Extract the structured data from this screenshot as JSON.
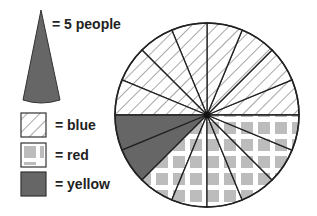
{
  "chart_data": {
    "type": "pie",
    "title": "",
    "unit_label": "= 5 people",
    "unit_value": 5,
    "segment_count": 16,
    "categories": [
      "blue",
      "red",
      "yellow"
    ],
    "segments": [
      8,
      6,
      2
    ],
    "values": [
      40,
      30,
      10
    ],
    "legend": [
      {
        "label": "= blue",
        "pattern": "diagonal-hatch"
      },
      {
        "label": "= red",
        "pattern": "square-grid"
      },
      {
        "label": "= yellow",
        "pattern": "solid-dark"
      }
    ]
  },
  "legend": {
    "unit": "= 5 people",
    "blue": "= blue",
    "red": "= red",
    "yellow": "= yellow"
  },
  "colors": {
    "outline": "#222222",
    "hatch": "#a8a8a8",
    "grid_square": "#bcbcbc",
    "dark_fill": "#666666"
  }
}
